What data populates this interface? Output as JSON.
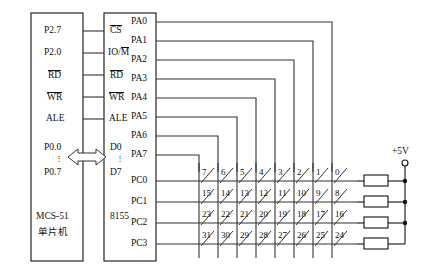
{
  "diagram": {
    "language": "zh-CN"
  },
  "mcu_block": {
    "name_line1": "MCS-51",
    "name_line2": "单片机",
    "pins_left": [],
    "pins_right": [
      {
        "label": "P2.7",
        "overline": false
      },
      {
        "label": "P2.0",
        "overline": false
      },
      {
        "label": "RD",
        "overline": true
      },
      {
        "label": "WR",
        "overline": true
      },
      {
        "label": "ALE",
        "overline": false
      },
      {
        "label": "P0.0",
        "overline": false
      },
      {
        "label": "⋮",
        "overline": false
      },
      {
        "label": "P0.7",
        "overline": false
      }
    ]
  },
  "chip_8155": {
    "name": "8155",
    "pins_left": [
      {
        "label": "CS",
        "overline": true
      },
      {
        "label": "IO/M",
        "overline": "partial"
      },
      {
        "label": "RD",
        "overline": true
      },
      {
        "label": "WR",
        "overline": true
      },
      {
        "label": "ALE",
        "overline": false
      },
      {
        "label": "D0",
        "overline": false
      },
      {
        "label": "⋮",
        "overline": false
      },
      {
        "label": "D7",
        "overline": false
      }
    ],
    "pins_right": [
      {
        "label": "PA0"
      },
      {
        "label": "PA1"
      },
      {
        "label": "PA2"
      },
      {
        "label": "PA3"
      },
      {
        "label": "PA4"
      },
      {
        "label": "PA5"
      },
      {
        "label": "PA6"
      },
      {
        "label": "PA7"
      },
      {
        "label": "PC0"
      },
      {
        "label": "PC1"
      },
      {
        "label": "PC2"
      },
      {
        "label": "PC3"
      }
    ]
  },
  "bus": {
    "kind": "bidirectional-data-bus-arrow",
    "from": "P0.0-P0.7",
    "to": "D0-D7"
  },
  "keypad": {
    "rows": 4,
    "cols": 8,
    "row_drivers": [
      "PC0",
      "PC1",
      "PC2",
      "PC3"
    ],
    "col_drivers": [
      "PA7",
      "PA6",
      "PA5",
      "PA4",
      "PA3",
      "PA2",
      "PA1",
      "PA0"
    ],
    "key_numbers": [
      [
        7,
        6,
        5,
        4,
        3,
        2,
        1,
        0
      ],
      [
        15,
        14,
        13,
        12,
        11,
        10,
        9,
        8
      ],
      [
        23,
        22,
        21,
        20,
        19,
        18,
        17,
        16
      ],
      [
        31,
        30,
        29,
        28,
        27,
        26,
        25,
        24
      ]
    ]
  },
  "power": {
    "label": "+5V",
    "pullup_count": 4
  },
  "colors": {
    "ink": "#111111",
    "wire": "#333333",
    "background": "#ffffff"
  }
}
